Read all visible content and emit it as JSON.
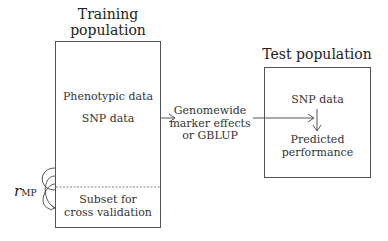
{
  "training": {
    "title_line1": "Training",
    "title_line2": "population",
    "phenotypic": "Phenotypic data",
    "snp": "SNP data",
    "subset_line1": "Subset for",
    "subset_line2": "cross validation"
  },
  "middle": {
    "line1": "Genomewide",
    "line2": "marker effects",
    "line3": "or GBLUP"
  },
  "test": {
    "title": "Test population",
    "snp": "SNP data",
    "pred_line1": "Predicted",
    "pred_line2": "performance"
  },
  "correlation": {
    "symbol": "r",
    "subscript": "MP"
  }
}
